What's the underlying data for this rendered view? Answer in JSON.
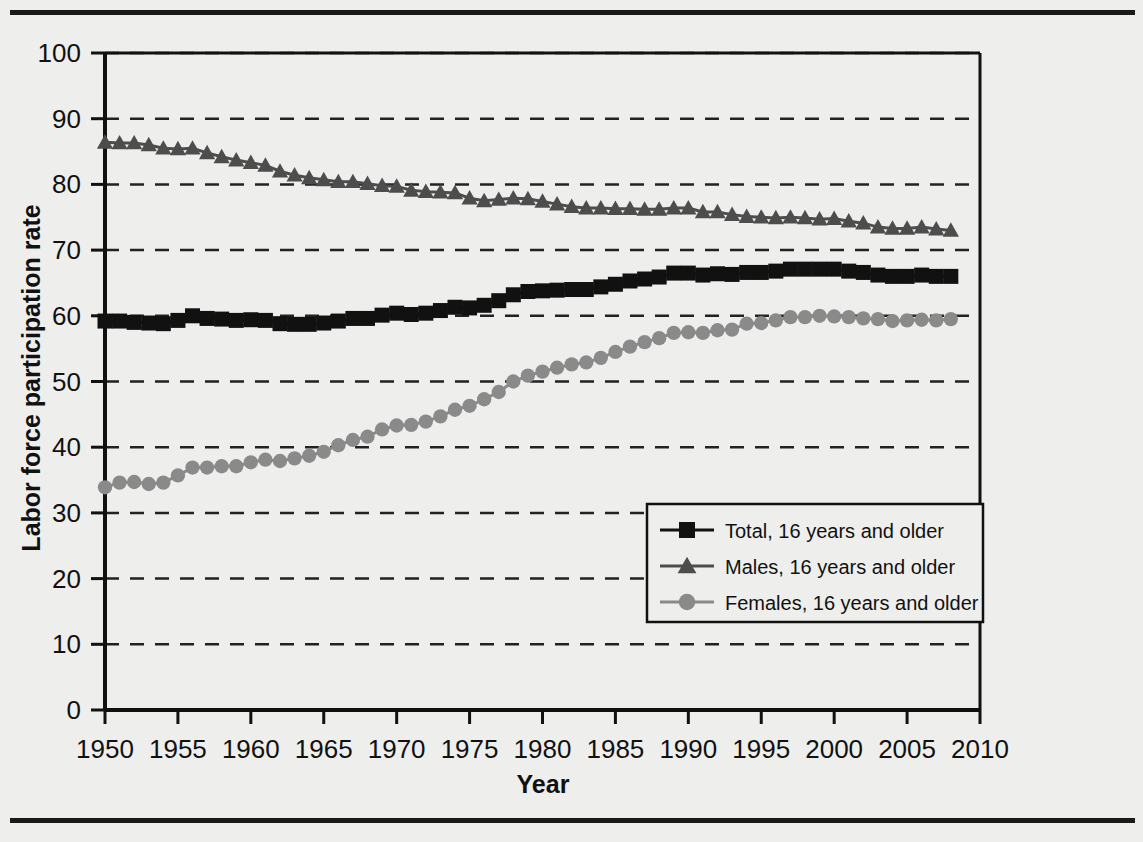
{
  "figure": {
    "name": "labor-force-participation-chart",
    "background_color": "#eeeeec",
    "rule_color": "#1a1a1a"
  },
  "chart_data": {
    "type": "line",
    "title": "",
    "xlabel": "Year",
    "ylabel": "Labor force participation rate",
    "xlim": [
      1950,
      2010
    ],
    "ylim": [
      0,
      100
    ],
    "xticks": [
      1950,
      1955,
      1960,
      1965,
      1970,
      1975,
      1980,
      1985,
      1990,
      1995,
      2000,
      2005,
      2010
    ],
    "yticks": [
      0,
      10,
      20,
      30,
      40,
      50,
      60,
      70,
      80,
      90,
      100
    ],
    "grid": "horizontal-dashed",
    "legend_position": "inside-lower-right",
    "x": [
      1950,
      1951,
      1952,
      1953,
      1954,
      1955,
      1956,
      1957,
      1958,
      1959,
      1960,
      1961,
      1962,
      1963,
      1964,
      1965,
      1966,
      1967,
      1968,
      1969,
      1970,
      1971,
      1972,
      1973,
      1974,
      1975,
      1976,
      1977,
      1978,
      1979,
      1980,
      1981,
      1982,
      1983,
      1984,
      1985,
      1986,
      1987,
      1988,
      1989,
      1990,
      1991,
      1992,
      1993,
      1994,
      1995,
      1996,
      1997,
      1998,
      1999,
      2000,
      2001,
      2002,
      2003,
      2004,
      2005,
      2006,
      2007,
      2008
    ],
    "series": [
      {
        "name": "Total, 16 years and older",
        "marker": "square",
        "color": "#111111",
        "values": [
          59.2,
          59.2,
          59.0,
          58.9,
          58.8,
          59.3,
          60.0,
          59.6,
          59.5,
          59.3,
          59.4,
          59.3,
          58.8,
          58.7,
          58.7,
          58.9,
          59.2,
          59.6,
          59.6,
          60.1,
          60.4,
          60.2,
          60.4,
          60.8,
          61.3,
          61.2,
          61.6,
          62.3,
          63.2,
          63.7,
          63.8,
          63.9,
          64.0,
          64.0,
          64.4,
          64.8,
          65.3,
          65.6,
          65.9,
          66.5,
          66.5,
          66.2,
          66.4,
          66.3,
          66.6,
          66.6,
          66.8,
          67.1,
          67.1,
          67.1,
          67.1,
          66.8,
          66.6,
          66.2,
          66.0,
          66.0,
          66.2,
          66.0,
          66.0
        ]
      },
      {
        "name": "Males, 16 years and older",
        "marker": "triangle",
        "color": "#4d4d4d",
        "values": [
          86.4,
          86.3,
          86.3,
          86.0,
          85.5,
          85.4,
          85.5,
          84.8,
          84.2,
          83.7,
          83.3,
          82.9,
          82.0,
          81.4,
          81.0,
          80.7,
          80.4,
          80.4,
          80.1,
          79.8,
          79.7,
          79.1,
          78.9,
          78.8,
          78.7,
          77.9,
          77.5,
          77.7,
          77.9,
          77.8,
          77.4,
          77.0,
          76.6,
          76.4,
          76.4,
          76.3,
          76.3,
          76.2,
          76.2,
          76.4,
          76.4,
          75.8,
          75.8,
          75.4,
          75.1,
          75.0,
          74.9,
          75.0,
          74.9,
          74.7,
          74.8,
          74.4,
          74.1,
          73.5,
          73.3,
          73.3,
          73.5,
          73.2,
          73.0
        ]
      },
      {
        "name": "Females, 16 years and older",
        "marker": "circle",
        "color": "#8a8a8a",
        "values": [
          33.9,
          34.6,
          34.7,
          34.4,
          34.6,
          35.7,
          36.9,
          36.9,
          37.1,
          37.1,
          37.7,
          38.1,
          37.9,
          38.3,
          38.7,
          39.3,
          40.3,
          41.1,
          41.6,
          42.7,
          43.3,
          43.4,
          43.9,
          44.7,
          45.7,
          46.3,
          47.3,
          48.4,
          50.0,
          50.9,
          51.5,
          52.1,
          52.6,
          52.9,
          53.6,
          54.5,
          55.3,
          56.0,
          56.6,
          57.4,
          57.5,
          57.4,
          57.8,
          57.9,
          58.8,
          58.9,
          59.3,
          59.8,
          59.8,
          60.0,
          59.9,
          59.8,
          59.6,
          59.5,
          59.2,
          59.3,
          59.4,
          59.3,
          59.5
        ]
      }
    ]
  },
  "legend": {
    "items": [
      {
        "label": "Total, 16 years and older",
        "marker": "square",
        "color": "#111111"
      },
      {
        "label": "Males, 16 years and older",
        "marker": "triangle",
        "color": "#4d4d4d"
      },
      {
        "label": "Females, 16 years and older",
        "marker": "circle",
        "color": "#8a8a8a"
      }
    ]
  }
}
